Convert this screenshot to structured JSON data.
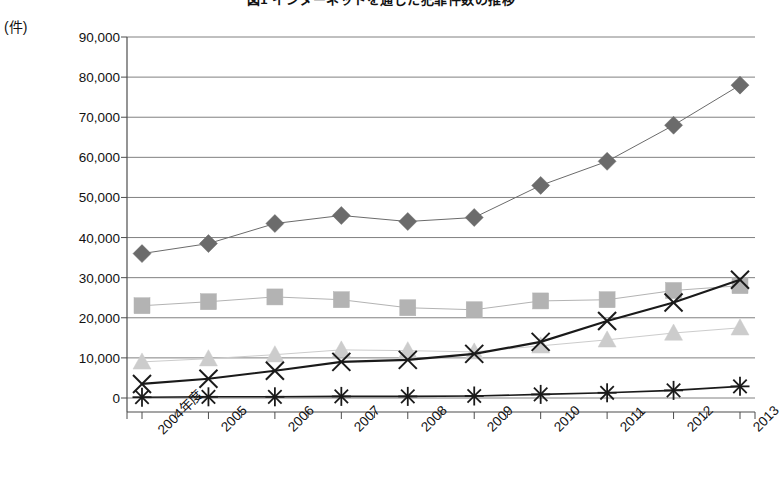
{
  "chart": {
    "title": "図1 インターネットを通じた犯罪件数の推移",
    "unit_label": "(件)",
    "axis": {
      "y_ticks": [
        "90,000",
        "80,000",
        "70,000",
        "60,000",
        "50,000",
        "40,000",
        "30,000",
        "20,000",
        "10,000",
        "0"
      ],
      "x_ticks": [
        "2004年度",
        "2005",
        "2006",
        "2007",
        "2008",
        "2009",
        "2010",
        "2011",
        "2012",
        "2013"
      ]
    },
    "colors": {
      "diamond": "#6b6b6b",
      "square": "#b3b3b3",
      "triangle": "#cccccc",
      "cross": "#1a1a1a",
      "star": "#1a1a1a",
      "gridline": "#808080",
      "axis": "#4d4d4d",
      "background": "#ffffff"
    }
  },
  "chart_data": {
    "type": "line",
    "title": "図1 インターネットを通じた犯罪件数の推移",
    "xlabel": "",
    "ylabel": "(件)",
    "ylim": [
      0,
      90000
    ],
    "ytick_step": 10000,
    "grid": true,
    "legend": "none",
    "categories": [
      "2004年度",
      "2005",
      "2006",
      "2007",
      "2008",
      "2009",
      "2010",
      "2011",
      "2012",
      "2013"
    ],
    "series": [
      {
        "name": "series-1",
        "marker": "diamond",
        "color": "#6b6b6b",
        "values": [
          36000,
          38500,
          43500,
          45500,
          44000,
          45000,
          53000,
          59000,
          68000,
          78000
        ]
      },
      {
        "name": "series-2",
        "marker": "square",
        "color": "#b3b3b3",
        "values": [
          23000,
          24000,
          25200,
          24500,
          22500,
          22000,
          24200,
          24500,
          26800,
          28000
        ]
      },
      {
        "name": "series-3",
        "marker": "triangle",
        "color": "#cccccc",
        "values": [
          9000,
          9800,
          10800,
          12000,
          11800,
          11500,
          13000,
          14500,
          16200,
          17500
        ]
      },
      {
        "name": "series-4",
        "marker": "cross",
        "color": "#1a1a1a",
        "values": [
          3500,
          4800,
          6800,
          9000,
          9500,
          11000,
          14000,
          19200,
          23800,
          29500
        ]
      },
      {
        "name": "series-5",
        "marker": "star",
        "color": "#1a1a1a",
        "values": [
          200,
          300,
          300,
          400,
          400,
          500,
          900,
          1300,
          1900,
          2900
        ]
      }
    ]
  }
}
